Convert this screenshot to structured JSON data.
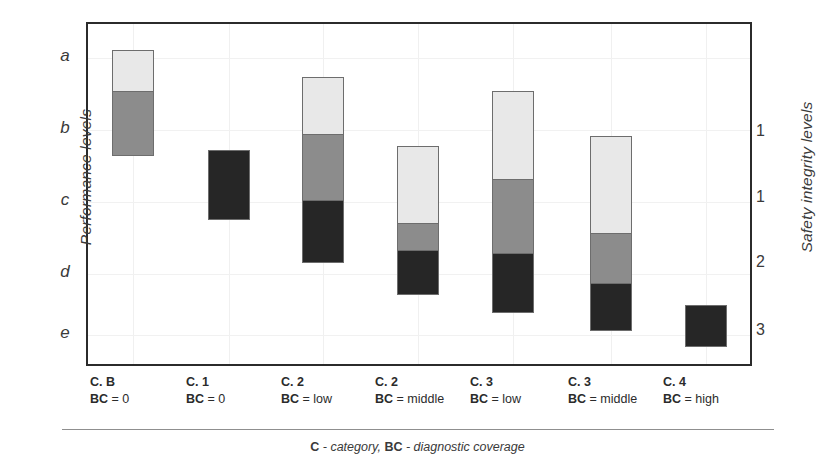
{
  "axes": {
    "left_title": "Performance levels",
    "right_title": "Safety integrity levels",
    "left_ticks": [
      "a",
      "b",
      "c",
      "d",
      "e"
    ],
    "right_ticks": [
      "1",
      "1",
      "2",
      "3"
    ]
  },
  "footer": {
    "caption_key1": "C",
    "caption_mid": " - category, ",
    "caption_key2": "BC",
    "caption_end": " - diagnostic coverage"
  },
  "categories": [
    {
      "line1": "C. B",
      "key": "BC",
      "value": " = 0"
    },
    {
      "line1": "C. 1",
      "key": "BC",
      "value": " = 0"
    },
    {
      "line1": "C. 2",
      "key": "BC",
      "value": " = low"
    },
    {
      "line1": "C. 2",
      "key": "BC",
      "value": " = middle"
    },
    {
      "line1": "C. 3",
      "key": "BC",
      "value": " = low"
    },
    {
      "line1": "C. 3",
      "key": "BC",
      "value": " = middle"
    },
    {
      "line1": "C. 4",
      "key": "BC",
      "value": " = high"
    }
  ],
  "colors": {
    "light": "#e8e8e8",
    "mid": "#8c8c8c",
    "dark": "#262626",
    "border": "#6d6d6d",
    "frame": "#2b2b2b",
    "grid": "#f0f0f0"
  },
  "chart_data": {
    "type": "bar",
    "title": "",
    "xlabel": "",
    "ylabel": "Performance levels",
    "y2label": "Safety integrity levels",
    "grid": true,
    "legend": "none",
    "orientation": "vertical",
    "stacked": true,
    "note": "Floating stacked range bars. Y axis is an inverted ordinal scale a(top) -> e(bottom); values are expressed as fractional level positions where a=0.0, b=1.0, c=2.0, d=3.0, e=4.0 measured downward.",
    "categories": [
      "C. B / BC = 0",
      "C. 1 / BC = 0",
      "C. 2 / BC = low",
      "C. 2 / BC = middle",
      "C. 3 / BC = low",
      "C. 3 / BC = middle",
      "C. 4 / BC = high"
    ],
    "yticks_left": [
      "a",
      "b",
      "c",
      "d",
      "e"
    ],
    "yticks_right": [
      "1",
      "1",
      "2",
      "3"
    ],
    "ylim_levels": [
      "a",
      "e"
    ],
    "series": [
      {
        "name": "light",
        "color": "#e8e8e8",
        "spans": [
          {
            "category": "C. B / BC = 0",
            "top_level": "a",
            "bottom_level": "a+0.58",
            "top_px": 48,
            "bottom_px": 90
          },
          {
            "category": "C. 1 / BC = 0",
            "top_level": null,
            "bottom_level": null,
            "top_px": null,
            "bottom_px": null
          },
          {
            "category": "C. 2 / BC = low",
            "top_level": "a+0.74",
            "bottom_level": "b+0.07",
            "top_px": 75,
            "bottom_px": 133
          },
          {
            "category": "C. 2 / BC = middle",
            "top_level": "b+0.22",
            "bottom_level": "c+0.31",
            "top_px": 144,
            "bottom_px": 222
          },
          {
            "category": "C. 3 / BC = low",
            "top_level": "a+0.46",
            "bottom_level": "b+0.70",
            "top_px": 89,
            "bottom_px": 178
          },
          {
            "category": "C. 3 / BC = middle",
            "top_level": "b+0.09",
            "bottom_level": "c+0.45",
            "top_px": 134,
            "bottom_px": 232
          },
          {
            "category": "C. 4 / BC = high",
            "top_level": null,
            "bottom_level": null,
            "top_px": null,
            "bottom_px": null
          }
        ]
      },
      {
        "name": "mid",
        "color": "#8c8c8c",
        "spans": [
          {
            "category": "C. B / BC = 0",
            "top_level": "a+0.58",
            "bottom_level": "b+0.48",
            "top_px": 90,
            "bottom_px": 155
          },
          {
            "category": "C. 1 / BC = 0",
            "top_level": null,
            "bottom_level": null,
            "top_px": null,
            "bottom_px": null
          },
          {
            "category": "C. 2 / BC = low",
            "top_level": "b+0.07",
            "bottom_level": "c+0.00",
            "top_px": 133,
            "bottom_px": 200
          },
          {
            "category": "C. 2 / BC = middle",
            "top_level": "c+0.31",
            "bottom_level": "c+0.70",
            "top_px": 222,
            "bottom_px": 250
          },
          {
            "category": "C. 3 / BC = low",
            "top_level": "b+0.70",
            "bottom_level": "c+0.74",
            "top_px": 178,
            "bottom_px": 253
          },
          {
            "category": "C. 3 / BC = middle",
            "top_level": "c+0.45",
            "bottom_level": "d+0.15",
            "top_px": 232,
            "bottom_px": 283
          },
          {
            "category": "C. 4 / BC = high",
            "top_level": null,
            "bottom_level": null,
            "top_px": null,
            "bottom_px": null
          }
        ]
      },
      {
        "name": "dark",
        "color": "#262626",
        "spans": [
          {
            "category": "C. B / BC = 0",
            "top_level": null,
            "bottom_level": null,
            "top_px": null,
            "bottom_px": null
          },
          {
            "category": "C. 1 / BC = 0",
            "top_level": "b+0.28",
            "bottom_level": "c+0.25",
            "top_px": 148,
            "bottom_px": 218
          },
          {
            "category": "C. 2 / BC = low",
            "top_level": "c+0.00",
            "bottom_level": "c+0.87",
            "top_px": 200,
            "bottom_px": 263
          },
          {
            "category": "C. 2 / BC = middle",
            "top_level": "c+0.70",
            "bottom_level": "d+0.32",
            "top_px": 250,
            "bottom_px": 295
          },
          {
            "category": "C. 3 / BC = low",
            "top_level": "c+0.74",
            "bottom_level": "d+0.57",
            "top_px": 253,
            "bottom_px": 313
          },
          {
            "category": "C. 3 / BC = middle",
            "top_level": "d+0.15",
            "bottom_level": "d+0.82",
            "top_px": 283,
            "bottom_px": 331
          },
          {
            "category": "C. 4 / BC = high",
            "top_level": "d+0.43",
            "bottom_level": "e+0.17",
            "top_px": 303,
            "bottom_px": 345
          }
        ]
      }
    ]
  },
  "geometry": {
    "frame": {
      "left": 86,
      "top": 22,
      "width": 666,
      "height": 344
    },
    "bar_width": 42,
    "bar_x": [
      110,
      206,
      300,
      395,
      490,
      588,
      683
    ],
    "left_tick_y": [
      56,
      128,
      200,
      272,
      333
    ],
    "right_tick_y": [
      131,
      197,
      262,
      330
    ],
    "vgrid_x": [
      110,
      206,
      300,
      395,
      490,
      588,
      683
    ],
    "hgrid_y": [
      56,
      128,
      200,
      272,
      333
    ],
    "xlabel_x": [
      90,
      186,
      281,
      375,
      470,
      568,
      663
    ]
  }
}
